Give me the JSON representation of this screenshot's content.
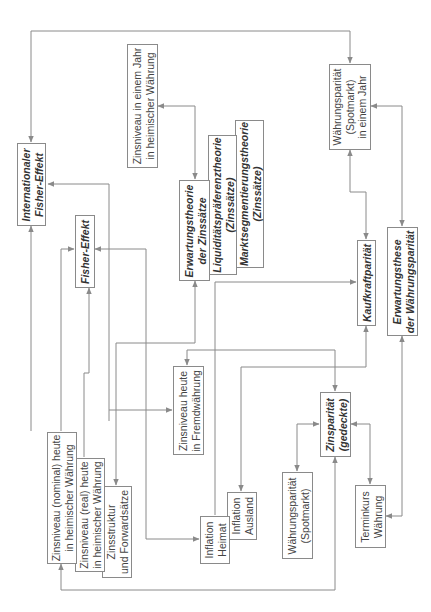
{
  "diagram": {
    "title": "",
    "nodes": {
      "int_fisher": {
        "lines": [
          "Internationaler",
          "Fisher-Effekt"
        ],
        "kind": "theory"
      },
      "zins_jahr_heim": {
        "lines": [
          "Zinsniveau in einem Jahr",
          "in heimischer Währung"
        ],
        "kind": "variable"
      },
      "fisher": {
        "lines": [
          "Fisher-Effekt"
        ],
        "kind": "theory"
      },
      "erwartungstheorie": {
        "lines": [
          "Erwartungstheorie",
          "der Zinssätze"
        ],
        "kind": "theory"
      },
      "liquiditaet": {
        "lines": [
          "Liquiditätspräferenztheorie",
          "(Zinssätze)"
        ],
        "kind": "theory"
      },
      "marktsegment": {
        "lines": [
          "Marktsegmentierungstheorie",
          "(Zinssätze)"
        ],
        "kind": "theory"
      },
      "wp_spot_jahr": {
        "lines": [
          "Währungsparität",
          "(Spotmarkt)",
          "in einem Jahr"
        ],
        "kind": "variable"
      },
      "kaufkraft": {
        "lines": [
          "Kaufkraftparität"
        ],
        "kind": "theory"
      },
      "erw_waehrung": {
        "lines": [
          "Erwartungsthese",
          "der Währungsparität"
        ],
        "kind": "theory"
      },
      "zins_heute_fremd": {
        "lines": [
          "Zinsniveau heute",
          "in Fremdwährung"
        ],
        "kind": "variable"
      },
      "zins_nominal": {
        "lines": [
          "Zinsniveau (nominal) heute",
          "in heimischer Währung"
        ],
        "kind": "variable"
      },
      "zins_real": {
        "lines": [
          "Zinsniveau (real) heute",
          "in heimischer Währung"
        ],
        "kind": "variable"
      },
      "zinsstruktur": {
        "lines": [
          "Zinsstruktur",
          "und Forwardsätze"
        ],
        "kind": "variable"
      },
      "inflation_heimat": {
        "lines": [
          "Inflation",
          "Heimat"
        ],
        "kind": "variable"
      },
      "inflation_ausland": {
        "lines": [
          "Inflation",
          "Ausland"
        ],
        "kind": "variable"
      },
      "zinsparitaet": {
        "lines": [
          "Zinsparität",
          "(gedeckte)"
        ],
        "kind": "theory"
      },
      "wp_spot": {
        "lines": [
          "Währungsparität",
          "(Spotmarkt)"
        ],
        "kind": "variable"
      },
      "terminkurs": {
        "lines": [
          "Terminkurs",
          "Währung"
        ],
        "kind": "variable"
      }
    },
    "edges": [
      {
        "from": "int_fisher",
        "to": "wp_spot_jahr",
        "type": "arrow"
      },
      {
        "from": "zins_nominal",
        "to": "int_fisher",
        "type": "arrow"
      },
      {
        "from": "zins_heute_fremd",
        "to": "int_fisher",
        "type": "arrow"
      },
      {
        "from": "zins_jahr_heim",
        "to": "erwartungstheorie",
        "type": "bidirectional"
      },
      {
        "from": "zins_nominal",
        "to": "fisher",
        "type": "arrow"
      },
      {
        "from": "zins_real",
        "to": "fisher",
        "type": "arrow"
      },
      {
        "from": "inflation_heimat",
        "to": "fisher",
        "type": "arrow"
      },
      {
        "from": "erwartungstheorie",
        "to": "zinsstruktur",
        "type": "arrow"
      },
      {
        "from": "liquiditaet",
        "to": "kaufkraft",
        "type": "arrow"
      },
      {
        "from": "wp_spot_jahr",
        "to": "kaufkraft",
        "type": "bidirectional"
      },
      {
        "from": "wp_spot_jahr",
        "to": "erw_waehrung",
        "type": "bidirectional"
      },
      {
        "from": "kaufkraft",
        "to": "inflation_ausland",
        "type": "arrow"
      },
      {
        "from": "zins_heute_fremd",
        "to": "zinsparitaet",
        "type": "arrow"
      },
      {
        "from": "zinsparitaet",
        "to": "wp_spot",
        "type": "bidirectional"
      },
      {
        "from": "zinsparitaet",
        "to": "terminkurs",
        "type": "bidirectional"
      },
      {
        "from": "erw_waehrung",
        "to": "terminkurs",
        "type": "arrow"
      },
      {
        "from": "zinsparitaet",
        "to": "zins_nominal",
        "type": "arrow"
      }
    ]
  },
  "colors": {
    "line": "#8a8a8a",
    "text": "#444444",
    "background": "#ffffff"
  }
}
